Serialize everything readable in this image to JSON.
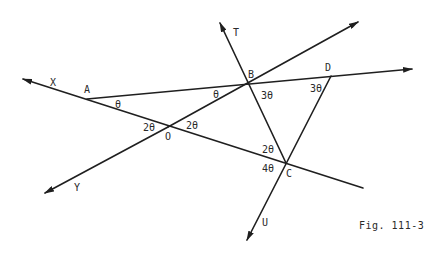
{
  "figure": {
    "caption": "Fig. 111-3",
    "points": {
      "X": "X",
      "A": "A",
      "O": "O",
      "Y": "Y",
      "T": "T",
      "B": "B",
      "D": "D",
      "C": "C",
      "U": "U"
    },
    "angles": {
      "A_theta": "θ",
      "B_left_theta": "θ",
      "B_3theta": "3θ",
      "D_3theta": "3θ",
      "O_left_2theta": "2θ",
      "O_right_2theta": "2θ",
      "C_2theta": "2θ",
      "C_4theta": "4θ"
    },
    "lines": [
      {
        "name": "line-XC",
        "from": "X",
        "through": [
          "A",
          "O",
          "C"
        ],
        "arrow": "X"
      },
      {
        "name": "line-YB",
        "from": "Y",
        "through": [
          "O",
          "B"
        ],
        "arrow": "both"
      },
      {
        "name": "line-AD",
        "from": "A",
        "through": [
          "B",
          "D"
        ],
        "arrow": "end"
      },
      {
        "name": "line-TC",
        "from": "T",
        "through": [
          "B",
          "C"
        ],
        "arrow": "T"
      },
      {
        "name": "line-DU",
        "from": "D",
        "through": [
          "C"
        ],
        "arrow": "U"
      }
    ]
  }
}
